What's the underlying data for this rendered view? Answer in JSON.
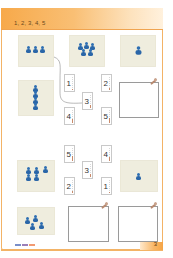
{
  "header": {
    "title": "1, 2, 3, 4, 5"
  },
  "colors": {
    "accent": "#f7a94a",
    "pawn": "#2a66a8",
    "photo_bg": "#efedde"
  },
  "section_top": {
    "photos": [
      {
        "id": "photo-3-pawns",
        "count": 3
      },
      {
        "id": "photo-5-pawns",
        "count": 5
      },
      {
        "id": "photo-1-pawn",
        "count": 1
      },
      {
        "id": "photo-4-stacked",
        "count": 4
      }
    ],
    "number_cards": [
      {
        "value": "1"
      },
      {
        "value": "2"
      },
      {
        "value": "3"
      },
      {
        "value": "4"
      },
      {
        "value": "5"
      }
    ],
    "draw_box": {
      "label": ""
    }
  },
  "section_bottom": {
    "photos": [
      {
        "id": "photo-5-pawns-group",
        "count": 5
      },
      {
        "id": "photo-1-pawn-small",
        "count": 1
      },
      {
        "id": "photo-4-pawns-scattered",
        "count": 4
      }
    ],
    "number_cards": [
      {
        "value": "5"
      },
      {
        "value": "4"
      },
      {
        "value": "3"
      },
      {
        "value": "2"
      },
      {
        "value": "1"
      }
    ],
    "draw_boxes": [
      {
        "label": ""
      },
      {
        "label": ""
      }
    ]
  },
  "footer": {
    "legend_colors": [
      "#7a8fc9",
      "#9a7fb8",
      "#f29a72"
    ],
    "page_number": "3"
  }
}
